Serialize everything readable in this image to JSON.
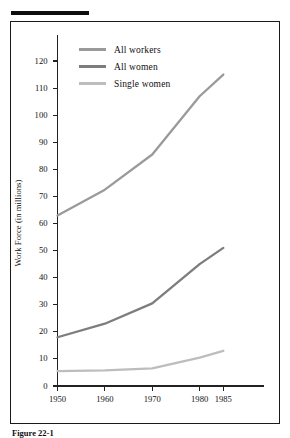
{
  "figure": {
    "caption": "Figure 22-1",
    "rule_color": "#0d0d0d",
    "frame_color": "#1a1a1a",
    "background": "#ffffff"
  },
  "chart_data": {
    "type": "line",
    "title": "",
    "xlabel": "",
    "ylabel": "Work Force (in millions)",
    "x": [
      1950,
      1960,
      1970,
      1980,
      1985
    ],
    "xtick_labels": [
      "1950",
      "1960",
      "1970",
      "1980",
      "1985"
    ],
    "ylim": [
      0,
      125
    ],
    "ytick_labels": [
      "0",
      "10",
      "20",
      "30",
      "40",
      "50",
      "60",
      "70",
      "80",
      "90",
      "100",
      "110",
      "120"
    ],
    "ytick_values": [
      0,
      10,
      20,
      30,
      40,
      50,
      60,
      70,
      80,
      90,
      100,
      110,
      120
    ],
    "grid": false,
    "legend_position": "upper-left-inside",
    "series": [
      {
        "name": "All workers",
        "color": "#9a9a9a",
        "values": [
          63,
          72.5,
          85.5,
          107,
          115
        ]
      },
      {
        "name": "All women",
        "color": "#7d7d7d",
        "values": [
          18,
          23,
          30.5,
          45,
          51
        ]
      },
      {
        "name": "Single women",
        "color": "#bdbdbd",
        "values": [
          5.5,
          5.8,
          6.5,
          10.5,
          13
        ]
      }
    ]
  }
}
